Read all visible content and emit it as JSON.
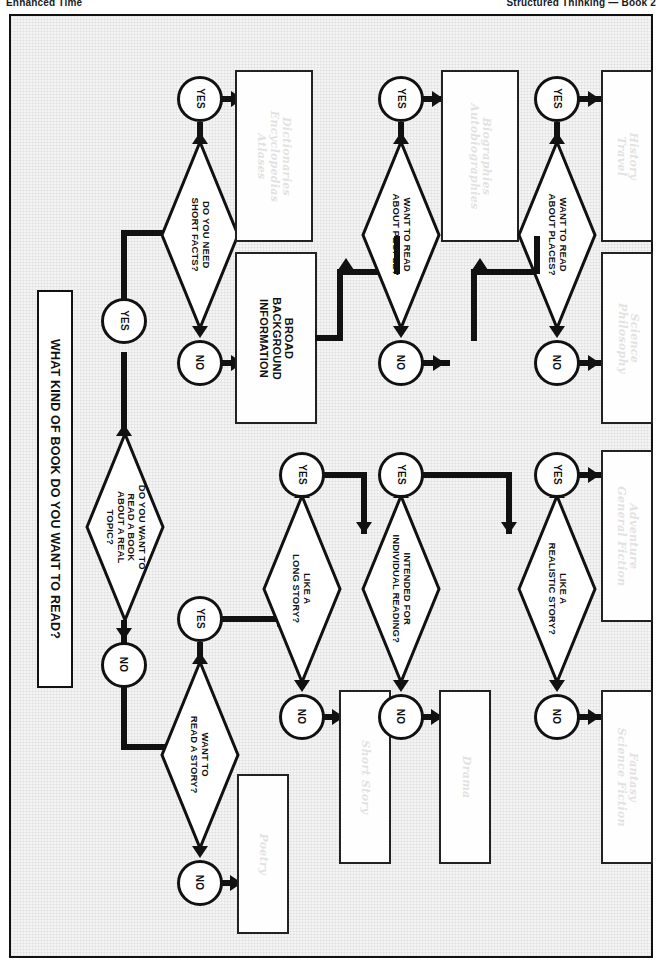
{
  "running_head": {
    "left": "Enhanced Time",
    "right": "Structured Thinking — Book 2"
  },
  "chart_data": {
    "type": "flowchart",
    "title": "WHAT KIND OF BOOK DO YOU WANT TO READ?",
    "orientation": "rotated-90-clockwise",
    "decisions": [
      {
        "id": "real_topic",
        "label": "DO YOU WANT TO\nREAD A BOOK\nABOUT A REAL\nTOPIC?"
      },
      {
        "id": "short_facts",
        "label": "DO YOU NEED\nSHORT FACTS?"
      },
      {
        "id": "about_people",
        "label": "WANT TO READ\nABOUT PEOPLE?"
      },
      {
        "id": "about_places",
        "label": "WANT TO READ\nABOUT PLACES?"
      },
      {
        "id": "read_story",
        "label": "WANT TO\nREAD A STORY?"
      },
      {
        "id": "long_story",
        "label": "LIKE A\nLONG STORY?"
      },
      {
        "id": "individual",
        "label": "INTENDED FOR\nINDIVIDUAL READING?"
      },
      {
        "id": "realistic",
        "label": "LIKE A\nREALISTIC STORY?"
      }
    ],
    "branch_labels": {
      "yes": "YES",
      "no": "NO"
    },
    "results": [
      {
        "id": "reference",
        "label": "Dictionaries\nEncyclopedias\nAtlases",
        "style": "ghost"
      },
      {
        "id": "broad_bg",
        "label": "BROAD\nBACKGROUND\nINFORMATION",
        "style": "solid"
      },
      {
        "id": "biography",
        "label": "Biographies\nAutobiographies",
        "style": "ghost"
      },
      {
        "id": "history",
        "label": "History\nTravel",
        "style": "ghost"
      },
      {
        "id": "science",
        "label": "Science\nPhilosophy",
        "style": "ghost"
      },
      {
        "id": "poetry",
        "label": "Poetry",
        "style": "ghost"
      },
      {
        "id": "short_story",
        "label": "Short Story",
        "style": "ghost"
      },
      {
        "id": "drama",
        "label": "Drama",
        "style": "ghost"
      },
      {
        "id": "adventure",
        "label": "Adventure\nGeneral Fiction",
        "style": "ghost"
      },
      {
        "id": "fantasy",
        "label": "Fantasy\nScience Fiction",
        "style": "ghost"
      }
    ],
    "colors": {
      "stroke": "#111111",
      "ghost_text": "#e2e2e2",
      "page_background": "#f4f4f4"
    }
  }
}
